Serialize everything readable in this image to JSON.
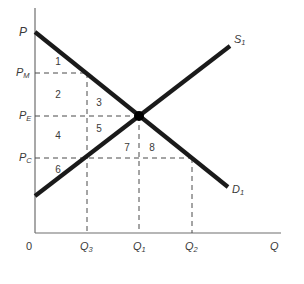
{
  "diagram": {
    "type": "supply-demand",
    "colors": {
      "curve": "#1a1a1a",
      "axis": "#6e6e6e",
      "dashed": "#4a4a4a",
      "label": "#3a3a3a",
      "background": "#ffffff"
    },
    "axes": {
      "origin_label": "0",
      "x_label": "Q",
      "y_label": "P"
    },
    "y_ticks": [
      {
        "id": "pm",
        "base": "P",
        "sub": "M"
      },
      {
        "id": "pe",
        "base": "P",
        "sub": "E"
      },
      {
        "id": "pc",
        "base": "P",
        "sub": "C"
      }
    ],
    "x_ticks": [
      {
        "id": "q3",
        "base": "Q",
        "sub": "3"
      },
      {
        "id": "q1",
        "base": "Q",
        "sub": "1"
      },
      {
        "id": "q2",
        "base": "Q",
        "sub": "2"
      }
    ],
    "curves": {
      "supply": {
        "base": "S",
        "sub": "1"
      },
      "demand": {
        "base": "D",
        "sub": "1"
      }
    },
    "equilibrium_point": "E",
    "areas": [
      "1",
      "2",
      "3",
      "4",
      "5",
      "6",
      "7",
      "8"
    ]
  }
}
